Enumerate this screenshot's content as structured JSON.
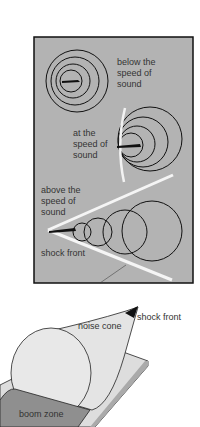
{
  "panel": {
    "background": "#b3b3b3",
    "border": "#111111",
    "sections": [
      {
        "id": "below",
        "label_lines": [
          "below the",
          "speed of",
          "sound"
        ]
      },
      {
        "id": "at",
        "label_lines": [
          "at the",
          "speed of",
          "sound"
        ]
      },
      {
        "id": "above",
        "label_lines": [
          "above the",
          "speed of",
          "sound"
        ]
      }
    ],
    "shock_front_label": "shock front"
  },
  "cone": {
    "noise_cone_label": "noise cone",
    "shock_front_label": "shock front",
    "boom_zone_label": "boom zone"
  }
}
